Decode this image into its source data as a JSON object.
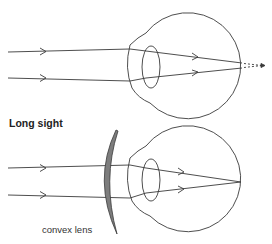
{
  "diagrams": [
    {
      "id": "short-sight-uncorrected",
      "title": "",
      "description": "Parallel rays focus in front of retina; dashed lines show extension to retina"
    },
    {
      "id": "long-sight-corrected",
      "title": "Long sight",
      "lens_label": "convex lens"
    }
  ],
  "colors": {
    "line": "#3a3a3a",
    "lens_fill": "#7d7d7d"
  }
}
